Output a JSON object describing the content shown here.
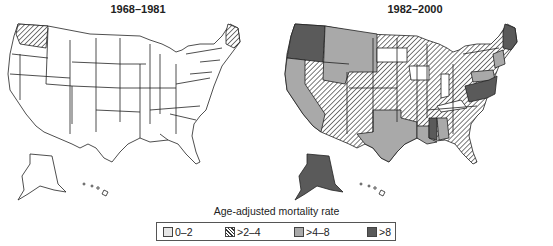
{
  "figure": {
    "panels": [
      {
        "title": "1968–1981"
      },
      {
        "title": "1982–2000"
      }
    ],
    "legend": {
      "title": "Age-adjusted mortality rate",
      "items": [
        {
          "label": "0–2",
          "class": "none",
          "color": "#e6e6e6"
        },
        {
          "label": ">2–4",
          "class": "hatch",
          "color": "hatched"
        },
        {
          "label": ">4–8",
          "class": "mid",
          "color": "#a9a9a9"
        },
        {
          "label": ">8",
          "class": "high",
          "color": "#5a5a5a"
        }
      ]
    }
  },
  "map_data": {
    "type": "choropleth",
    "region": "United States",
    "measure": "Age-adjusted mortality rate",
    "periods": {
      "1968–1981": {
        ">2–4": [
          "Washington",
          "Maine"
        ],
        "0–2": [
          "all other states"
        ]
      },
      "1982–2000": {
        ">8": [
          "Washington",
          "Oregon",
          "Alaska",
          "Maine",
          "West Virginia",
          "Virginia",
          "Maryland",
          "Delaware",
          "New Jersey",
          "Mississippi"
        ],
        ">4–8": [
          "California",
          "Idaho",
          "Montana",
          "Wyoming",
          "Texas",
          "Louisiana",
          "Alabama",
          "Pennsylvania",
          "New Hampshire",
          "Vermont",
          "Massachusetts",
          "Connecticut",
          "Rhode Island"
        ],
        ">2–4": [
          "Nevada",
          "Utah",
          "Arizona",
          "Colorado",
          "New Mexico",
          "North Dakota",
          "Nebraska",
          "Kansas",
          "Oklahoma",
          "Minnesota",
          "Wisconsin",
          "Michigan",
          "Illinois",
          "Missouri",
          "Arkansas",
          "Tennessee",
          "Georgia",
          "Florida",
          "South Carolina",
          "North Carolina",
          "Ohio",
          "New York"
        ],
        "0–2": [
          "South Dakota",
          "Iowa",
          "Indiana",
          "Kentucky",
          "Hawaii"
        ]
      }
    }
  }
}
